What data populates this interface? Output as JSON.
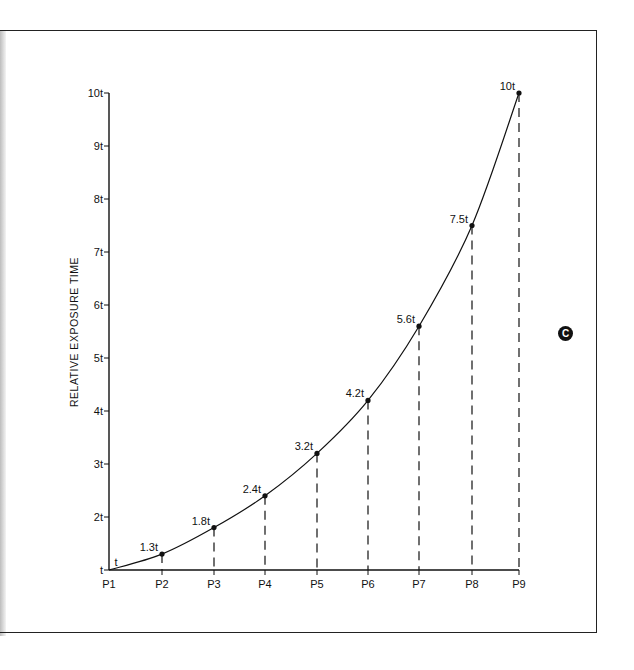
{
  "chart_data": {
    "type": "line",
    "title": "",
    "xlabel": "",
    "ylabel": "RELATIVE EXPOSURE TIME",
    "categories": [
      "P1",
      "P2",
      "P3",
      "P4",
      "P5",
      "P6",
      "P7",
      "P8",
      "P9"
    ],
    "series": [
      {
        "name": "Relative exposure time",
        "values": [
          1,
          1.3,
          1.8,
          2.4,
          3.2,
          4.2,
          5.6,
          7.5,
          10
        ],
        "point_labels": [
          "t",
          "1.3t",
          "1.8t",
          "2.4t",
          "3.2t",
          "4.2t",
          "5.6t",
          "7.5t",
          "10t"
        ]
      }
    ],
    "ylim": [
      1,
      10
    ],
    "yticks": [
      1,
      2,
      3,
      4,
      5,
      6,
      7,
      8,
      9,
      10
    ],
    "ytick_labels": [
      "t",
      "2t",
      "3t",
      "4t",
      "5t",
      "6t",
      "7t",
      "8t",
      "9t",
      "10t"
    ],
    "grid": false,
    "drop_lines": "dashed",
    "legend": "none"
  },
  "badge": {
    "label": "C"
  }
}
